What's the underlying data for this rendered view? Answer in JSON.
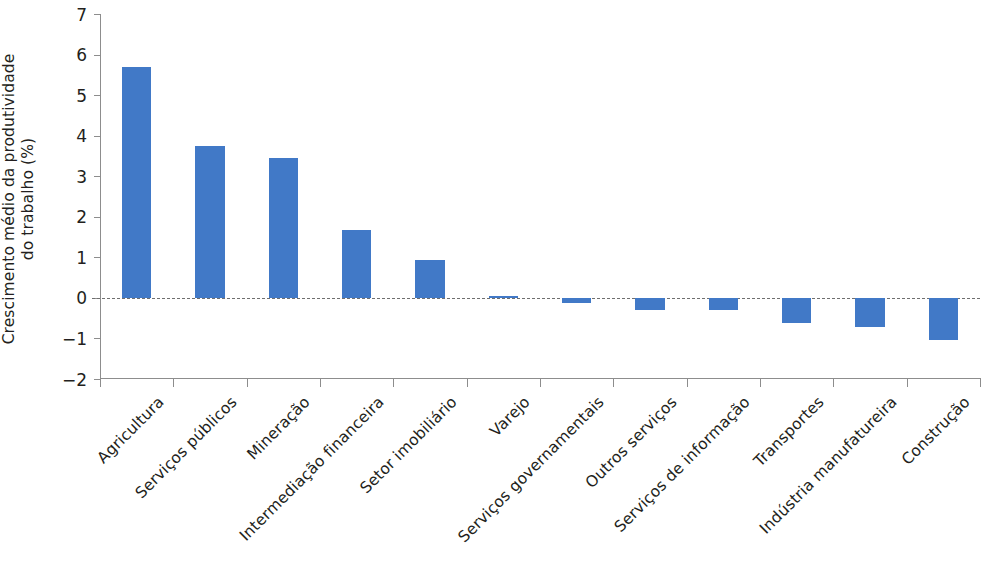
{
  "chart_data": {
    "type": "bar",
    "title": "",
    "subtitle": "",
    "xlabel": "",
    "ylabel": "Crescimento médio da produtividade\ndo trabalho (%)",
    "ylim": [
      -2,
      7
    ],
    "yticks": [
      7,
      6,
      5,
      4,
      3,
      2,
      1,
      0,
      -1,
      -2
    ],
    "ytick_labels": [
      "7",
      "6",
      "5",
      "4",
      "3",
      "2",
      "1",
      "0",
      "−1",
      "−2"
    ],
    "grid": false,
    "legend": null,
    "zero_reference_line": true,
    "bar_color": "#4179c7",
    "axis_color": "#8d8d8d",
    "text_color": "#231f20",
    "categories": [
      "Agricultura",
      "Serviços públicos",
      "Mineração",
      "Intermediação financeira",
      "Setor imobiliário",
      "Varejo",
      "Serviços governamentais",
      "Outros serviços",
      "Serviços de informação",
      "Transportes",
      "Indústria manufatureira",
      "Construção"
    ],
    "values": [
      5.7,
      3.74,
      3.45,
      1.67,
      0.93,
      0.05,
      -0.12,
      -0.3,
      -0.3,
      -0.62,
      -0.72,
      -1.05
    ]
  }
}
